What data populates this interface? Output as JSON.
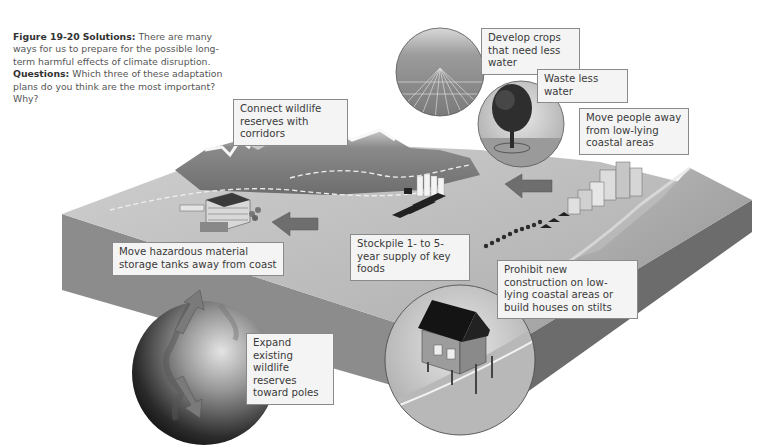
{
  "caption": {
    "figure_number": "Figure 19-20",
    "title_bold": "Solutions:",
    "text": "There are many ways for us to prepare for the possible long-term harmful effects of climate disruption.",
    "questions_bold": "Questions:",
    "questions_text": "Which three of these adaptation plans do you think are the most important? Why?"
  },
  "labels": {
    "crops": "Develop crops that need less water",
    "water": "Waste less water",
    "people": "Move people away from low-lying coastal areas",
    "corridors": "Connect wildlife reserves with corridors",
    "hazardous": "Move hazardous material storage tanks away from coast",
    "stockpile": "Stockpile 1- to 5-year supply of key foods",
    "construction": "Prohibit new construction on low-lying coastal areas or build houses on stilts",
    "reserves": "Expand existing wildlife reserves toward poles"
  },
  "illustration": {
    "elements": [
      "mountains",
      "crop-field-inset",
      "tree-inset",
      "coastal-city",
      "food-silos",
      "industrial-plant",
      "stilt-house-inset",
      "globe-inset",
      "arrows"
    ],
    "palette": {
      "land_top": "#b9b9b9",
      "land_side_left": "#8f8f8f",
      "land_side_front": "#6f6f6f",
      "ocean": "#a8a8a8",
      "arrow": "#7c7c7c",
      "label_bg": "#f4f4f4",
      "label_border": "#8a8a8a"
    }
  }
}
